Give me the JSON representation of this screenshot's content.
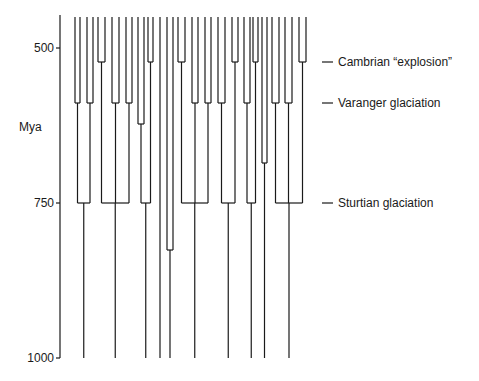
{
  "axis": {
    "unit_label": "Mya",
    "ticks": [
      {
        "label": "500",
        "value": 500
      },
      {
        "label": "750",
        "value": 750
      },
      {
        "label": "1000",
        "value": 1000
      }
    ]
  },
  "events": [
    {
      "label": "Cambrian “explosion”",
      "mya": 522
    },
    {
      "label": "Varanger glaciation",
      "mya": 590
    },
    {
      "label": "Sturtian glaciation",
      "mya": 750
    }
  ],
  "chart_data": {
    "type": "tree",
    "title": "",
    "ylabel": "Mya",
    "ylim": [
      1000,
      447
    ],
    "yticks": [
      500,
      750,
      1000
    ],
    "annotations": [
      {
        "text": "Cambrian “explosion”",
        "mya": 522
      },
      {
        "text": "Varanger glaciation",
        "mya": 590
      },
      {
        "text": "Sturtian glaciation",
        "mya": 750
      }
    ],
    "root_lineages_at_1000": 10,
    "node_ages_mya": [
      522,
      590,
      625,
      665,
      750,
      826
    ]
  },
  "colors": {
    "line": "#1a1a1a",
    "background": "#ffffff"
  }
}
